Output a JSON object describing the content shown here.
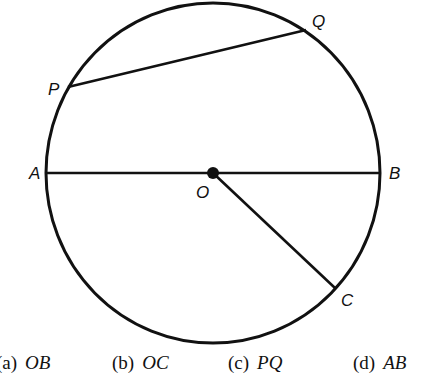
{
  "diagram": {
    "circle": {
      "cx": 213,
      "cy": 173,
      "rx": 167,
      "ry": 170,
      "stroke": "#111111"
    },
    "center": {
      "name": "O",
      "x": 213,
      "y": 173,
      "label_x": 196,
      "label_y": 198
    },
    "points": {
      "A": {
        "x": 46,
        "y": 173,
        "label": "A",
        "label_x": 29,
        "label_y": 179
      },
      "B": {
        "x": 380,
        "y": 173,
        "label": "B",
        "label_x": 389,
        "label_y": 179
      },
      "P": {
        "x": 68,
        "y": 87,
        "label": "P",
        "label_x": 48,
        "label_y": 95
      },
      "Q": {
        "x": 306,
        "y": 30,
        "label": "Q",
        "label_x": 312,
        "label_y": 27
      },
      "C": {
        "x": 335,
        "y": 288,
        "label": "C",
        "label_x": 341,
        "label_y": 306
      }
    },
    "segments": [
      {
        "name": "diameter-AB",
        "from": "A",
        "to": "B"
      },
      {
        "name": "chord-PQ",
        "from": "P",
        "to": "Q"
      },
      {
        "name": "radius-OC",
        "from": "O",
        "to": "C"
      }
    ]
  },
  "options": [
    {
      "label": "(a)",
      "value": "OB"
    },
    {
      "label": "(b)",
      "value": "OC"
    },
    {
      "label": "(c)",
      "value": "PQ"
    },
    {
      "label": "(d)",
      "value": "AB"
    }
  ]
}
